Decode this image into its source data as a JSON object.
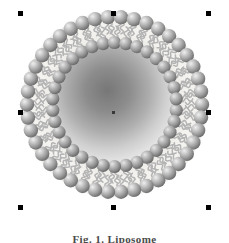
{
  "figure": {
    "caption": "Fig. 1. Liposome",
    "background_color": "#ffffff",
    "canvas": {
      "width": 229,
      "height": 243
    }
  },
  "vesicle": {
    "name": "liposome-vesicle",
    "center": {
      "x": 114,
      "y": 104
    },
    "outer_radius": 100,
    "inner_lumen_radius": 57,
    "bilayer_thickness": 43,
    "lipid_count_outer": 42,
    "lipid_count_inner": 34,
    "head_color_light": "#e8e8e8",
    "head_color_mid": "#a8a8a8",
    "head_color_dark": "#6e6e6e",
    "tail_color": "#b4b4b4",
    "membrane_band_color": "#eceae6",
    "lumen_gradient_center": "#7d7d7d",
    "lumen_gradient_edge": "#e2e2e2",
    "parts": [
      {
        "name": "outer-head-group",
        "label": "Hydrophilic head (outer leaflet)"
      },
      {
        "name": "inner-head-group",
        "label": "Hydrophilic head (inner leaflet)"
      },
      {
        "name": "lipid-tail",
        "label": "Hydrophobic fatty-acid tails"
      },
      {
        "name": "aqueous-lumen",
        "label": "Aqueous core"
      }
    ]
  },
  "selection": {
    "active": true,
    "handle_color": "#000000",
    "handle_size": 5,
    "handles": [
      {
        "name": "handle-top-left",
        "position": "top-left"
      },
      {
        "name": "handle-top-center",
        "position": "top-center"
      },
      {
        "name": "handle-top-right",
        "position": "top-right"
      },
      {
        "name": "handle-middle-left",
        "position": "middle-left"
      },
      {
        "name": "handle-middle-right",
        "position": "middle-right"
      },
      {
        "name": "handle-bottom-left",
        "position": "bottom-left"
      },
      {
        "name": "handle-bottom-center",
        "position": "bottom-center"
      },
      {
        "name": "handle-bottom-right",
        "position": "bottom-right"
      },
      {
        "name": "handle-center",
        "position": "center"
      }
    ]
  }
}
